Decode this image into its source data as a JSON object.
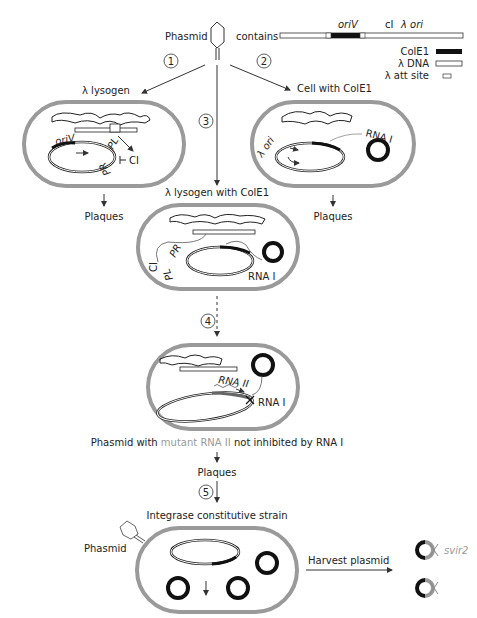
{
  "header": {
    "phasmid_label": "Phasmid",
    "contains_label": "contains",
    "construct_labels": {
      "oriV": "oriV",
      "cI": "cI",
      "lambda_ori": "λ ori"
    }
  },
  "legend": {
    "items": [
      {
        "label": "ColE1",
        "swatch": "black-bar"
      },
      {
        "label": "λ DNA",
        "swatch": "white-bar"
      },
      {
        "label": "λ att site",
        "swatch": "att-box"
      }
    ]
  },
  "steps": {
    "s1": "1",
    "s2": "2",
    "s3": "3",
    "s4": "4",
    "s5": "5"
  },
  "cells": {
    "lysogen": {
      "title": "λ lysogen",
      "oriV": "oriV",
      "pl": "PL",
      "pr": "PR",
      "ci": "CI",
      "result": "Plaques"
    },
    "cole1": {
      "title": "Cell with ColE1",
      "lambda_ori": "λ ori",
      "rna1": "RNA I",
      "result": "Plaques"
    },
    "lysogen_cole1": {
      "title": "λ lysogen with ColE1",
      "ci": "CI",
      "pr": "PR",
      "pl": "PL",
      "rna1": "RNA I"
    },
    "mutant": {
      "rna2": "RNA II",
      "rna1": "RNA I"
    },
    "integrase": {
      "title": "Integrase constitutive strain",
      "phasmid": "Phasmid"
    }
  },
  "captions": {
    "mutant_prefix": "Phasmid with ",
    "mutant_highlight": "mutant RNA II",
    "mutant_suffix": " not inhibited by RNA I",
    "plaques": "Plaques",
    "harvest": "Harvest plasmid",
    "svir2": "svir2"
  },
  "colors": {
    "cell_wall": "#9a9a9a",
    "ink": "#222222",
    "highlight": "#9a9a9a"
  }
}
